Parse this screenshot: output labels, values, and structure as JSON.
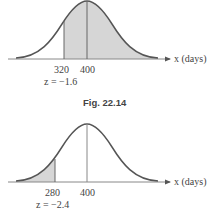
{
  "figures": [
    {
      "id": "top",
      "caption": "Fig. 22.14",
      "axis_label": "x (days)",
      "ticks": [
        "320",
        "400"
      ],
      "z_label": "z = −1.6",
      "shading": "right of 320",
      "mean": 400,
      "cut": 320,
      "z": -1.6
    },
    {
      "id": "bottom",
      "caption": "",
      "axis_label": "x (days)",
      "ticks": [
        "280",
        "400"
      ],
      "z_label": "z = −2.4",
      "shading": "left of 280",
      "mean": 400,
      "cut": 280,
      "z": -2.4
    }
  ],
  "colors": {
    "curve": "#555555",
    "fill": "#d6d6d6",
    "axis": "#888888"
  }
}
